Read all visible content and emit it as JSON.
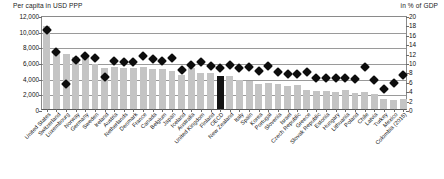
{
  "chart_data": {
    "type": "bar",
    "title": "",
    "subtitle": "",
    "left_axis": {
      "label": "Per capita in USD PPP",
      "ticks": [
        "0",
        "2,000",
        "4,000",
        "6,000",
        "8,000",
        "10,000",
        "12,000"
      ],
      "tick_values": [
        0,
        2000,
        4000,
        6000,
        8000,
        10000,
        12000
      ],
      "ylim": [
        0,
        12000
      ]
    },
    "right_axis": {
      "label": "in % of GDP",
      "ticks": [
        "0",
        "2",
        "4",
        "6",
        "8",
        "10",
        "12",
        "14",
        "16",
        "18",
        "20"
      ],
      "tick_values": [
        0,
        2,
        4,
        6,
        8,
        10,
        12,
        14,
        16,
        18,
        20
      ],
      "ylim": [
        0,
        20
      ]
    },
    "grid": true,
    "legend_position": "none",
    "highlight_category": "OECD",
    "highlight_color": "#141414",
    "bar_color": "#c4c4c4",
    "marker_color": "#0d0d0d",
    "categories": [
      "United States",
      "Switzerland",
      "Luxembourg",
      "Norway",
      "Germany",
      "Sweden",
      "Ireland",
      "Austria",
      "Netherlands",
      "Denmark",
      "France",
      "Canada",
      "Belgium",
      "Japan",
      "Iceland",
      "Australia",
      "United Kingdom",
      "Finland",
      "OECD",
      "New Zealand",
      "Italy",
      "Spain",
      "Korea",
      "Portugal",
      "Slovenia",
      "Israel",
      "Czech Republic",
      "Greece",
      "Slovak Republic",
      "Estonia",
      "Hungary",
      "Lithuania",
      "Poland",
      "Chile",
      "Latvia",
      "Turkey",
      "Mexico",
      "Colombia (2015)"
    ],
    "series": [
      {
        "name": "Per capita in USD PPP",
        "axis": "left",
        "render": "bar",
        "values": [
          10586,
          7317,
          7032,
          6647,
          6646,
          5782,
          5276,
          5395,
          5288,
          5299,
          5376,
          5155,
          5071,
          4823,
          4349,
          5187,
          4653,
          4578,
          4224,
          4204,
          3649,
          3616,
          3192,
          3379,
          3224,
          2932,
          3033,
          2384,
          2354,
          2306,
          2222,
          2416,
          2056,
          2182,
          1973,
          1227,
          1154,
          1222
        ]
      },
      {
        "name": "in % of GDP",
        "axis": "right",
        "render": "diamond",
        "values": [
          16.9,
          12.2,
          5.4,
          10.5,
          11.2,
          10.9,
          6.9,
          10.3,
          10.0,
          10.0,
          11.2,
          10.7,
          10.3,
          10.9,
          8.3,
          9.3,
          10.0,
          9.1,
          8.8,
          9.3,
          8.8,
          8.9,
          8.1,
          9.1,
          7.9,
          7.5,
          7.5,
          7.8,
          6.7,
          6.7,
          6.6,
          6.5,
          6.3,
          9.0,
          6.2,
          4.2,
          5.5,
          7.2
        ]
      }
    ]
  }
}
